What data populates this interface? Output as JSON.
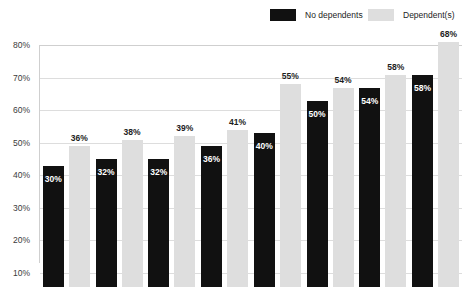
{
  "legend": {
    "position": "top-right",
    "items": [
      {
        "label": "No dependents",
        "color": "#111111",
        "swatch": "black-swatch"
      },
      {
        "label": "Dependent(s)",
        "color": "#dedede",
        "swatch": "gray-swatch"
      }
    ]
  },
  "axis": {
    "y_ticks": [
      "80%",
      "70%",
      "60%",
      "50%",
      "40%",
      "30%",
      "20%",
      "10%"
    ]
  },
  "chart_data": {
    "type": "bar",
    "title": "",
    "subtitle": "",
    "xlabel": "",
    "ylabel": "",
    "ylim": [
      0,
      80
    ],
    "ytick_values": [
      80,
      70,
      60,
      50,
      40,
      30,
      20,
      10
    ],
    "ytick_labels": [
      "80%",
      "70%",
      "60%",
      "50%",
      "40%",
      "30%",
      "20%",
      "10%"
    ],
    "grid": true,
    "grid_axis": "y",
    "legend_position": "top-right",
    "categories": [
      "1",
      "2",
      "3",
      "4",
      "5",
      "6",
      "7",
      "8"
    ],
    "category_labels_visible": false,
    "series": [
      {
        "name": "No dependents",
        "color": "#111111",
        "values": [
          30,
          32,
          32,
          36,
          40,
          50,
          54,
          58
        ],
        "labels": [
          "30%",
          "32%",
          "32%",
          "36%",
          "40%",
          "50%",
          "54%",
          "58%"
        ],
        "label_position": "inside-top"
      },
      {
        "name": "Dependent(s)",
        "color": "#dedede",
        "values": [
          36,
          38,
          39,
          41,
          55,
          54,
          58,
          68
        ],
        "labels": [
          "36%",
          "38%",
          "39%",
          "41%",
          "55%",
          "54%",
          "58%",
          "68%"
        ],
        "label_position": "outside-top"
      }
    ],
    "note": "chart is cropped at the bottom; bars extend below the visible frame"
  }
}
